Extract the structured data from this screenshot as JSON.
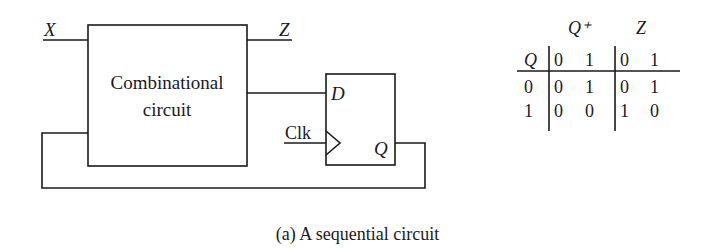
{
  "diagram": {
    "inputs": {
      "x_label": "X",
      "clk_label": "Clk"
    },
    "outputs": {
      "z_label": "Z"
    },
    "combinational_block": {
      "line1": "Combinational",
      "line2": "circuit"
    },
    "flip_flop": {
      "d_label": "D",
      "q_label": "Q"
    }
  },
  "table": {
    "group_headers": {
      "next_state": "Q⁺",
      "output": "Z"
    },
    "row_header": "Q",
    "column_inputs": [
      "0",
      "1",
      "0",
      "1"
    ],
    "rows": [
      {
        "q": "0",
        "values": [
          "0",
          "1",
          "0",
          "1"
        ]
      },
      {
        "q": "1",
        "values": [
          "0",
          "0",
          "1",
          "0"
        ]
      }
    ]
  },
  "caption": "(a) A sequential circuit"
}
